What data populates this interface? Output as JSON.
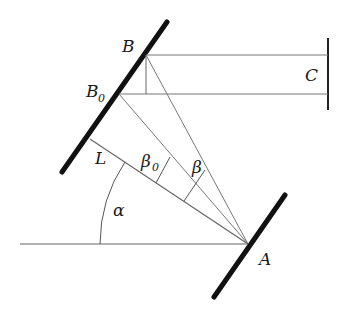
{
  "diagram": {
    "type": "optical geometry diagram",
    "labels": {
      "B": "B",
      "B0": "B",
      "B0_sub": "0",
      "C": "C",
      "L": "L",
      "A": "A",
      "alpha": "α",
      "beta0": "β",
      "beta0_sub": "0",
      "beta": "β"
    },
    "colors": {
      "mirror": "#111111",
      "thin_line": "#666666",
      "label": "#1a1a1a"
    }
  }
}
